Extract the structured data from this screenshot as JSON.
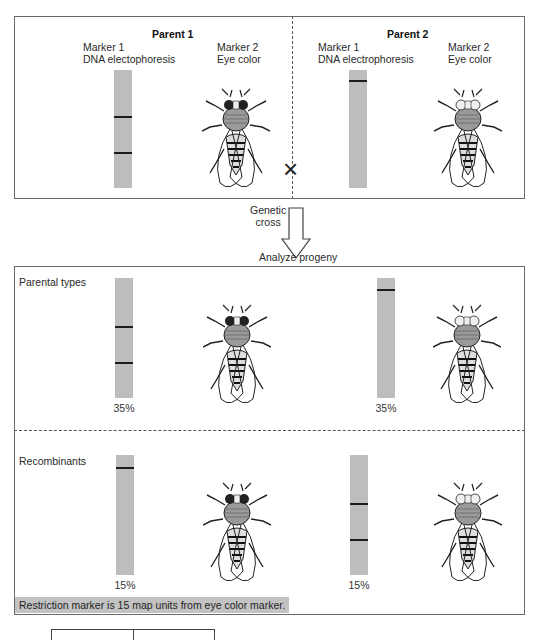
{
  "parents": {
    "parent1": {
      "title": "Parent 1",
      "marker1_line1": "Marker 1",
      "marker1_line2": "DNA electophoresis",
      "marker2_line1": "Marker 2",
      "marker2_line2": "Eye color",
      "eye": "dark"
    },
    "parent2": {
      "title": "Parent 2",
      "marker1_line1": "Marker 1",
      "marker1_line2": "DNA electrophoresis",
      "marker2_line1": "Marker 2",
      "marker2_line2": "Eye color",
      "eye": "light"
    },
    "cross_symbol": "×"
  },
  "arrow": {
    "label_line1": "Genetic",
    "label_line2": "cross",
    "analyze_label": "Analyze progeny"
  },
  "progeny": {
    "parental": {
      "label": "Parental types",
      "left_pct": "35%",
      "right_pct": "35%"
    },
    "recombinant": {
      "label": "Recombinants",
      "left_pct": "15%",
      "right_pct": "15%"
    },
    "conclusion": "Restriction marker is 15 map units from eye color marker."
  },
  "colors": {
    "gel": "#bdbdbd",
    "band": "#1c1c1c",
    "border": "#6a6a6a",
    "note_bg": "#c2c2c2"
  }
}
